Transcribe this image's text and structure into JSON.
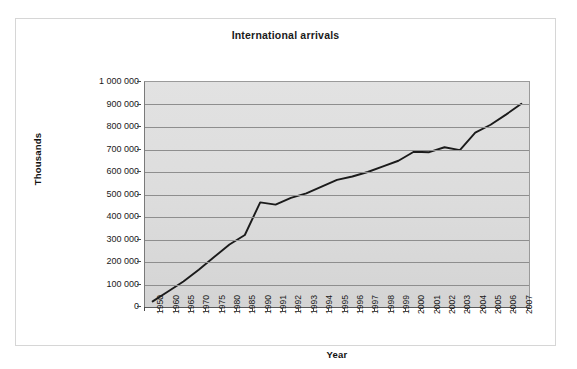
{
  "figure": {
    "title": "International arrivals",
    "x_axis_title": "Year",
    "y_axis_title": "Thousands",
    "line_color": "#1b1b1b",
    "plot_background": "#dedede",
    "gridline_color": "#8e8e8e",
    "frame_border_color": "#d6d6d6"
  },
  "chart_data": {
    "type": "line",
    "title": "International arrivals",
    "xlabel": "Year",
    "ylabel": "Thousands",
    "ylim": [
      0,
      1000000
    ],
    "ytick_labels": [
      "1 000 000",
      "900 000",
      "800 000",
      "700 000",
      "600 000",
      "500 000",
      "400 000",
      "300 000",
      "200 000",
      "100 000",
      "0"
    ],
    "ytick_values": [
      1000000,
      900000,
      800000,
      700000,
      600000,
      500000,
      400000,
      300000,
      200000,
      100000,
      0
    ],
    "grid": true,
    "legend": false,
    "categories": [
      "1950",
      "1960",
      "1965",
      "1970",
      "1975",
      "1980",
      "1985",
      "1990",
      "1991",
      "1992",
      "1993",
      "1994",
      "1995",
      "1996",
      "1997",
      "1998",
      "1999",
      "2000",
      "2001",
      "2002",
      "2003",
      "2004",
      "2005",
      "2006",
      "2007"
    ],
    "values": [
      25000,
      69000,
      113000,
      166000,
      222000,
      278000,
      320000,
      465000,
      455000,
      485000,
      505000,
      535000,
      565000,
      580000,
      600000,
      625000,
      650000,
      690000,
      688000,
      710000,
      697000,
      775000,
      810000,
      855000,
      903000
    ],
    "series": [
      {
        "name": "International arrivals",
        "values": [
          25000,
          69000,
          113000,
          166000,
          222000,
          278000,
          320000,
          465000,
          455000,
          485000,
          505000,
          535000,
          565000,
          580000,
          600000,
          625000,
          650000,
          690000,
          688000,
          710000,
          697000,
          775000,
          810000,
          855000,
          903000
        ]
      }
    ]
  }
}
